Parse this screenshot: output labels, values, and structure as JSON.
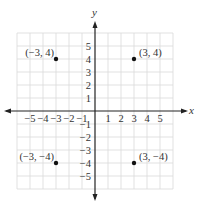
{
  "diagram": {
    "type": "coordinate-plane",
    "x_axis_label": "x",
    "y_axis_label": "y",
    "x_ticks": [
      "−5",
      "−4",
      "−3",
      "−2",
      "−1",
      "1",
      "2",
      "3",
      "4",
      "5"
    ],
    "y_ticks": [
      "5",
      "4",
      "3",
      "2",
      "1",
      "−1",
      "−2",
      "−3",
      "−4",
      "−5"
    ],
    "range": {
      "x": [
        -6,
        6
      ],
      "y": [
        -6,
        6
      ]
    },
    "grid": true,
    "points": [
      {
        "x": -3,
        "y": 4,
        "label": "(−3, 4)"
      },
      {
        "x": 3,
        "y": 4,
        "label": "(3, 4)"
      },
      {
        "x": -3,
        "y": -4,
        "label": "(−3, −4)"
      },
      {
        "x": 3,
        "y": -4,
        "label": "(3, −4)"
      }
    ],
    "colors": {
      "grid": "#d9d9d9",
      "axis": "#222222",
      "point": "#111111",
      "text": "#333333"
    }
  }
}
